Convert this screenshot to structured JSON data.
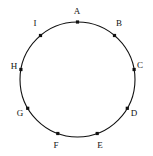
{
  "figure": {
    "kind": "circle-with-labeled-points",
    "width": 153,
    "height": 156,
    "background_color": "#ffffff",
    "stroke_color": "#111111",
    "marker_color": "#111111",
    "label_color": "#111111",
    "circle": {
      "cx": 77.5,
      "cy": 79.5,
      "r": 57.5,
      "stroke_width": 1.1
    },
    "marker": {
      "shape": "square",
      "size": 3.2
    },
    "points": [
      {
        "label": "A",
        "angle_deg": 90,
        "px": 77.5,
        "py": 22.0,
        "label_x": 77,
        "label_y": 11
      },
      {
        "label": "B",
        "angle_deg": 50,
        "px": 114.5,
        "py": 35.5,
        "label_x": 119,
        "label_y": 23
      },
      {
        "label": "C",
        "angle_deg": 10,
        "px": 134.1,
        "py": 69.5,
        "label_x": 140,
        "label_y": 65
      },
      {
        "label": "D",
        "angle_deg": -30,
        "px": 127.3,
        "py": 108.3,
        "label_x": 134,
        "label_y": 113
      },
      {
        "label": "E",
        "angle_deg": -70,
        "px": 97.2,
        "py": 133.5,
        "label_x": 100,
        "label_y": 145
      },
      {
        "label": "F",
        "angle_deg": -110,
        "px": 57.8,
        "py": 133.5,
        "label_x": 56,
        "label_y": 145
      },
      {
        "label": "G",
        "angle_deg": -150,
        "px": 27.7,
        "py": 108.3,
        "label_x": 20,
        "label_y": 113
      },
      {
        "label": "H",
        "angle_deg": 170,
        "px": 20.9,
        "py": 69.5,
        "label_x": 14,
        "label_y": 66
      },
      {
        "label": "I",
        "angle_deg": 130,
        "px": 40.5,
        "py": 35.5,
        "label_x": 35,
        "label_y": 23
      }
    ]
  }
}
